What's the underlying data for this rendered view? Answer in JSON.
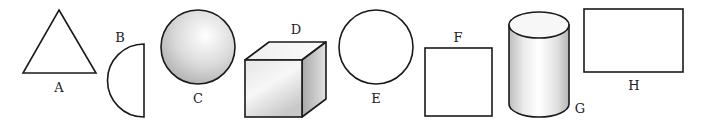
{
  "diagram": {
    "type": "geometric-shapes",
    "shapes": [
      {
        "id": "A",
        "label": "A",
        "shape": "triangle",
        "dimension": "2D"
      },
      {
        "id": "B",
        "label": "B",
        "shape": "semicircle",
        "dimension": "2D"
      },
      {
        "id": "C",
        "label": "C",
        "shape": "sphere",
        "dimension": "3D"
      },
      {
        "id": "D",
        "label": "D",
        "shape": "cube",
        "dimension": "3D"
      },
      {
        "id": "E",
        "label": "E",
        "shape": "circle",
        "dimension": "2D"
      },
      {
        "id": "F",
        "label": "F",
        "shape": "square",
        "dimension": "2D"
      },
      {
        "id": "G",
        "label": "G",
        "shape": "cylinder",
        "dimension": "3D"
      },
      {
        "id": "H",
        "label": "H",
        "shape": "rectangle",
        "dimension": "2D"
      }
    ],
    "colors": {
      "stroke": "#1a1a1a",
      "fill_2d": "#ffffff",
      "shade_light": "#fafafa",
      "shade_dark": "#b8b8b8"
    }
  }
}
